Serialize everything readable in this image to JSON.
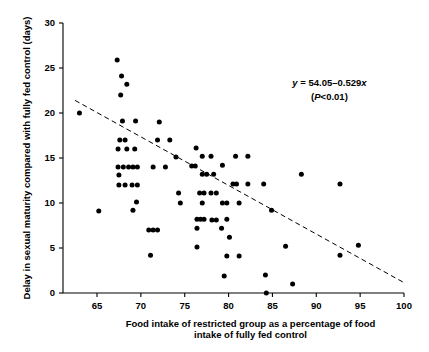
{
  "chart_data": {
    "type": "scatter",
    "title": "",
    "xlabel": "Food intake of restricted group as a percentage of food intake of fully fed control",
    "xlabel_line1": "Food intake of restricted group as a percentage of food",
    "xlabel_line2": "intake of fully fed control",
    "ylabel": "Delay in sexual maturity compared with fully fed control (days)",
    "xlim": [
      62,
      101
    ],
    "ylim": [
      0,
      30
    ],
    "xticks": [
      65,
      70,
      75,
      80,
      85,
      90,
      95,
      100
    ],
    "yticks": [
      0,
      5,
      10,
      15,
      20,
      25,
      30
    ],
    "xtick_labels": [
      "65",
      "70",
      "75",
      "80",
      "85",
      "90",
      "95",
      "100"
    ],
    "ytick_labels": [
      "0",
      "5",
      "10",
      "15",
      "20",
      "25",
      "30"
    ],
    "grid": false,
    "legend": null,
    "marker": "filled-circle",
    "marker_color": "#000000",
    "annotations": [
      {
        "name": "regression-equation",
        "text": "y = 54.05–0.529x",
        "x": 91.5,
        "y": 23.0
      },
      {
        "name": "significance",
        "text": "(P<0.01)",
        "x": 91.5,
        "y": 21.4
      }
    ],
    "trendline": {
      "style": "dashed",
      "equation": "y = 54.05 - 0.529x",
      "slope": -0.529,
      "intercept": 54.05,
      "x_start": 62.5,
      "y_start": 21.4,
      "x_end": 100.0,
      "y_end": 1.15
    },
    "points": [
      [
        63.0,
        20.0
      ],
      [
        65.2,
        9.1
      ],
      [
        67.3,
        25.9
      ],
      [
        67.8,
        24.1
      ],
      [
        68.4,
        23.2
      ],
      [
        67.7,
        22.0
      ],
      [
        67.9,
        19.1
      ],
      [
        69.4,
        19.1
      ],
      [
        72.1,
        19.0
      ],
      [
        67.6,
        17.0
      ],
      [
        68.2,
        17.0
      ],
      [
        71.9,
        17.0
      ],
      [
        73.3,
        17.0
      ],
      [
        67.4,
        16.0
      ],
      [
        68.4,
        16.0
      ],
      [
        69.3,
        16.0
      ],
      [
        76.3,
        16.1
      ],
      [
        74.0,
        15.1
      ],
      [
        77.0,
        15.2
      ],
      [
        78.0,
        15.2
      ],
      [
        80.8,
        15.2
      ],
      [
        82.2,
        15.2
      ],
      [
        67.4,
        14.0
      ],
      [
        68.0,
        14.0
      ],
      [
        68.6,
        14.0
      ],
      [
        69.1,
        14.0
      ],
      [
        69.6,
        14.0
      ],
      [
        71.4,
        14.0
      ],
      [
        72.8,
        14.0
      ],
      [
        75.8,
        14.1
      ],
      [
        76.2,
        14.1
      ],
      [
        79.3,
        14.2
      ],
      [
        67.5,
        13.1
      ],
      [
        77.0,
        13.2
      ],
      [
        77.5,
        13.2
      ],
      [
        78.3,
        13.2
      ],
      [
        88.3,
        13.2
      ],
      [
        67.5,
        12.0
      ],
      [
        68.2,
        12.0
      ],
      [
        69.0,
        12.0
      ],
      [
        69.6,
        12.0
      ],
      [
        80.5,
        12.1
      ],
      [
        80.9,
        12.1
      ],
      [
        82.2,
        12.1
      ],
      [
        84.0,
        12.1
      ],
      [
        92.7,
        12.1
      ],
      [
        74.3,
        11.1
      ],
      [
        76.7,
        11.1
      ],
      [
        77.2,
        11.1
      ],
      [
        78.0,
        11.1
      ],
      [
        78.6,
        11.1
      ],
      [
        69.5,
        10.1
      ],
      [
        74.5,
        10.0
      ],
      [
        77.0,
        10.0
      ],
      [
        79.3,
        10.0
      ],
      [
        79.8,
        10.0
      ],
      [
        81.2,
        10.0
      ],
      [
        69.1,
        9.2
      ],
      [
        84.9,
        9.2
      ],
      [
        76.4,
        8.2
      ],
      [
        76.8,
        8.2
      ],
      [
        77.2,
        8.2
      ],
      [
        78.1,
        8.1
      ],
      [
        78.6,
        8.1
      ],
      [
        79.8,
        8.2
      ],
      [
        76.4,
        7.2
      ],
      [
        79.2,
        7.2
      ],
      [
        70.9,
        7.0
      ],
      [
        71.4,
        7.0
      ],
      [
        71.9,
        7.0
      ],
      [
        80.1,
        6.2
      ],
      [
        86.5,
        5.2
      ],
      [
        94.8,
        5.3
      ],
      [
        76.4,
        5.1
      ],
      [
        71.1,
        4.2
      ],
      [
        79.8,
        4.1
      ],
      [
        81.2,
        4.1
      ],
      [
        92.7,
        4.2
      ],
      [
        84.2,
        2.0
      ],
      [
        79.5,
        1.9
      ],
      [
        87.3,
        1.0
      ],
      [
        84.3,
        0.0
      ]
    ]
  },
  "plot_geometry": {
    "left_px": 63,
    "right_px": 404,
    "top_px": 23,
    "bottom_px": 293
  }
}
